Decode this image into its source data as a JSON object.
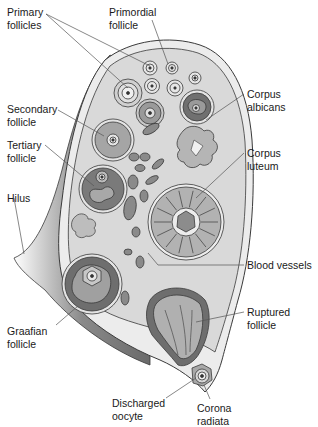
{
  "figure": {
    "labels": {
      "primary_follicles": "Primary\nfollicles",
      "primordial_follicle": "Primordial\nfollicle",
      "secondary_follicle": "Secondary\nfollicle",
      "corpus_albicans": "Corpus\nalbicans",
      "tertiary_follicle": "Tertiary\nfollicle",
      "corpus_luteum": "Corpus\nluteum",
      "hilus": "Hilus",
      "blood_vessels": "Blood vessels",
      "ruptured_follicle": "Ruptured\nfollicle",
      "graafian_follicle": "Graafian\nfollicle",
      "discharged_oocyte": "Discharged\noocyte",
      "corona_radiata": "Corona\nradiata"
    },
    "colors": {
      "stroma": "#d9d9d9",
      "capsule": "#ececec",
      "outline": "#3a3a3a",
      "dark_tissue": "#6e6e6e",
      "mid_tissue": "#9a9a9a",
      "light_tissue": "#bdbdbd",
      "leader_line": "#555555"
    }
  }
}
